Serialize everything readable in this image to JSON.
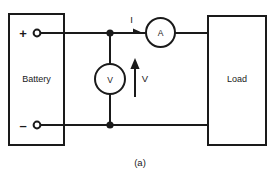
{
  "figure": {
    "caption": "(a)",
    "colors": {
      "wire": "#1a1a1a",
      "background": "#ffffff",
      "text": "#1a1a1a"
    }
  },
  "blocks": {
    "source": {
      "label": "Battery",
      "terminals": {
        "positive": "+",
        "negative": "–"
      }
    },
    "load": {
      "label": "Load"
    }
  },
  "meters": {
    "ammeter": {
      "symbol": "A",
      "name": "ammeter"
    },
    "voltmeter": {
      "symbol": "V",
      "name": "voltmeter"
    }
  },
  "annotations": {
    "current": {
      "label": "I",
      "direction": "right"
    },
    "voltage": {
      "label": "V",
      "direction": "up"
    }
  }
}
